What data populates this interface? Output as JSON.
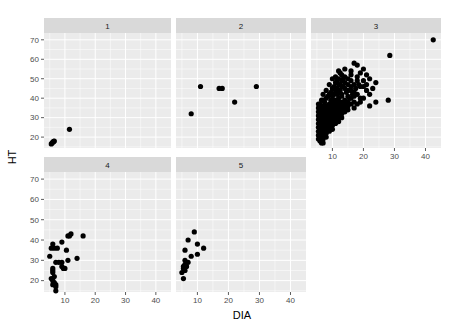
{
  "chart_data": {
    "type": "scatter",
    "title": "",
    "xlabel": "DIA",
    "ylabel": "HT",
    "facet_labels": [
      "1",
      "2",
      "3",
      "4",
      "5"
    ],
    "xlim": [
      3.1,
      45
    ],
    "ylim": [
      14.4,
      73.5
    ],
    "x_ticks": [
      10,
      20,
      30,
      40
    ],
    "y_ticks": [
      20,
      30,
      40,
      50,
      60,
      70
    ],
    "grid": true,
    "legend": "none",
    "colors": {
      "panel_bg": "#ebebeb",
      "strip_bg": "#d9d9d9",
      "grid": "#ffffff",
      "point": "#000000",
      "tick": "#333333"
    },
    "panels": [
      {
        "label": "1",
        "points": [
          [
            5.5,
            16.5
          ],
          [
            5.8,
            17
          ],
          [
            6.1,
            17.5
          ],
          [
            6.5,
            18
          ],
          [
            6.3,
            17.8
          ],
          [
            11.5,
            24
          ]
        ]
      },
      {
        "label": "2",
        "points": [
          [
            8,
            32
          ],
          [
            11,
            46
          ],
          [
            17,
            45
          ],
          [
            18,
            45
          ],
          [
            22,
            38
          ],
          [
            29,
            46
          ]
        ]
      },
      {
        "label": "3",
        "points": [
          [
            42.5,
            70
          ],
          [
            28.5,
            62
          ],
          [
            28,
            39
          ],
          [
            21,
            52
          ],
          [
            22,
            50
          ],
          [
            24,
            48
          ],
          [
            20,
            55
          ],
          [
            18,
            57
          ],
          [
            17,
            58
          ],
          [
            19,
            53
          ],
          [
            16,
            52
          ],
          [
            15,
            50
          ],
          [
            14,
            55
          ],
          [
            13,
            52
          ],
          [
            12,
            54
          ],
          [
            11,
            48
          ],
          [
            12,
            47
          ],
          [
            13,
            46
          ],
          [
            14,
            45
          ],
          [
            15,
            44
          ],
          [
            16,
            44
          ],
          [
            17,
            43
          ],
          [
            18,
            42
          ],
          [
            19,
            40
          ],
          [
            20,
            40
          ],
          [
            22,
            42
          ],
          [
            22,
            36
          ],
          [
            24,
            38
          ],
          [
            21,
            44
          ],
          [
            19,
            46
          ],
          [
            17,
            47
          ],
          [
            16,
            46
          ],
          [
            15,
            41
          ],
          [
            14,
            39
          ],
          [
            13,
            42
          ],
          [
            12,
            43
          ],
          [
            11,
            44
          ],
          [
            10,
            45
          ],
          [
            10,
            41
          ],
          [
            9,
            42
          ],
          [
            8,
            40
          ],
          [
            7,
            39
          ],
          [
            7,
            36
          ],
          [
            6,
            35
          ],
          [
            6,
            33
          ],
          [
            5.5,
            31
          ],
          [
            5.5,
            29
          ],
          [
            5.5,
            27
          ],
          [
            5.5,
            25
          ],
          [
            5.5,
            23
          ],
          [
            5.5,
            21
          ],
          [
            5.5,
            19
          ],
          [
            6,
            18
          ],
          [
            6.5,
            17
          ],
          [
            7,
            17
          ],
          [
            6,
            20
          ],
          [
            6,
            22
          ],
          [
            6,
            24
          ],
          [
            6,
            26
          ],
          [
            6,
            28
          ],
          [
            6,
            30
          ],
          [
            6.5,
            32
          ],
          [
            7,
            34
          ],
          [
            7,
            31
          ],
          [
            7,
            29
          ],
          [
            7,
            27
          ],
          [
            7,
            25
          ],
          [
            7,
            23
          ],
          [
            7,
            21
          ],
          [
            7,
            19
          ],
          [
            8,
            20
          ],
          [
            8,
            22
          ],
          [
            8,
            24
          ],
          [
            8,
            26
          ],
          [
            8,
            28
          ],
          [
            8,
            30
          ],
          [
            8,
            32
          ],
          [
            8,
            34
          ],
          [
            8,
            36
          ],
          [
            9,
            37
          ],
          [
            9,
            35
          ],
          [
            9,
            33
          ],
          [
            9,
            31
          ],
          [
            9,
            29
          ],
          [
            9,
            27
          ],
          [
            9,
            25
          ],
          [
            9,
            23
          ],
          [
            10,
            24
          ],
          [
            10,
            26
          ],
          [
            10,
            28
          ],
          [
            10,
            30
          ],
          [
            10,
            32
          ],
          [
            10,
            34
          ],
          [
            10,
            36
          ],
          [
            10,
            38
          ],
          [
            11,
            39
          ],
          [
            11,
            37
          ],
          [
            11,
            35
          ],
          [
            11,
            33
          ],
          [
            11,
            31
          ],
          [
            11,
            29
          ],
          [
            11,
            27
          ],
          [
            12,
            28
          ],
          [
            12,
            30
          ],
          [
            12,
            32
          ],
          [
            12,
            34
          ],
          [
            12,
            36
          ],
          [
            12,
            38
          ],
          [
            12,
            40
          ],
          [
            13,
            41
          ],
          [
            13,
            38
          ],
          [
            13,
            36
          ],
          [
            13,
            34
          ],
          [
            13,
            32
          ],
          [
            13,
            30
          ],
          [
            14,
            33
          ],
          [
            14,
            35
          ],
          [
            14,
            37
          ],
          [
            15,
            38
          ],
          [
            15,
            36
          ],
          [
            15,
            34
          ],
          [
            16,
            37
          ],
          [
            16,
            40
          ],
          [
            17,
            38
          ],
          [
            18,
            37
          ],
          [
            17,
            35
          ],
          [
            14,
            48
          ],
          [
            13,
            49
          ],
          [
            12,
            50
          ],
          [
            11,
            51
          ],
          [
            10,
            50
          ],
          [
            9,
            47
          ],
          [
            8,
            44
          ],
          [
            7,
            42
          ],
          [
            16,
            49
          ],
          [
            18,
            49
          ],
          [
            20,
            46
          ],
          [
            21,
            47
          ],
          [
            23,
            45
          ],
          [
            19,
            38
          ],
          [
            5.5,
            33
          ],
          [
            6,
            37
          ],
          [
            5.5,
            35
          ],
          [
            7.5,
            38
          ],
          [
            8.5,
            41
          ],
          [
            9.5,
            43
          ],
          [
            10.5,
            46
          ],
          [
            11.5,
            49
          ],
          [
            12.5,
            53
          ],
          [
            14,
            51
          ],
          [
            16,
            54
          ],
          [
            18,
            51
          ],
          [
            20,
            49
          ],
          [
            15,
            47
          ],
          [
            17,
            41
          ],
          [
            6.5,
            23
          ],
          [
            6.5,
            27
          ],
          [
            7.5,
            30
          ],
          [
            8.5,
            33
          ],
          [
            9.5,
            36
          ],
          [
            10.5,
            39
          ],
          [
            11.5,
            42
          ],
          [
            12.5,
            44
          ],
          [
            13.5,
            46
          ],
          [
            14.5,
            43
          ],
          [
            15.5,
            40
          ],
          [
            16.5,
            42
          ],
          [
            17.5,
            45
          ],
          [
            18.5,
            47
          ],
          [
            6.5,
            29
          ],
          [
            7.5,
            25
          ],
          [
            8.5,
            27
          ],
          [
            9.5,
            29
          ],
          [
            10.5,
            31
          ],
          [
            11.5,
            33
          ],
          [
            12.5,
            35
          ],
          [
            13.5,
            37
          ],
          [
            6,
            34
          ],
          [
            5.5,
            37
          ],
          [
            6.5,
            39
          ],
          [
            7.5,
            33
          ],
          [
            8.5,
            35
          ],
          [
            9.5,
            39
          ],
          [
            10.5,
            42
          ],
          [
            11.5,
            45
          ],
          [
            12.5,
            47
          ],
          [
            13.5,
            50
          ]
        ]
      },
      {
        "label": "4",
        "points": [
          [
            11.5,
            42
          ],
          [
            12,
            43
          ],
          [
            11,
            42
          ],
          [
            16,
            42
          ],
          [
            9,
            39
          ],
          [
            10.5,
            35
          ],
          [
            14,
            31
          ],
          [
            11,
            30
          ],
          [
            5,
            32
          ],
          [
            6,
            38
          ],
          [
            5.5,
            36
          ],
          [
            6.5,
            36
          ],
          [
            7.5,
            36
          ],
          [
            7,
            29
          ],
          [
            8,
            29
          ],
          [
            9,
            29
          ],
          [
            9,
            27
          ],
          [
            9.5,
            26
          ],
          [
            10,
            26
          ],
          [
            6,
            26
          ],
          [
            6,
            25
          ],
          [
            6,
            24
          ],
          [
            6.5,
            22
          ],
          [
            5.5,
            21
          ],
          [
            6,
            20
          ],
          [
            6.5,
            19
          ],
          [
            7,
            18
          ],
          [
            7,
            17
          ],
          [
            6,
            18
          ],
          [
            7,
            15
          ]
        ]
      },
      {
        "label": "5",
        "points": [
          [
            9,
            44
          ],
          [
            7,
            40
          ],
          [
            10,
            38
          ],
          [
            12,
            36
          ],
          [
            6,
            35
          ],
          [
            10,
            33
          ],
          [
            8,
            32
          ],
          [
            6,
            30
          ],
          [
            7,
            29
          ],
          [
            6,
            28
          ],
          [
            5.5,
            27
          ],
          [
            6.5,
            27
          ],
          [
            5.5,
            26
          ],
          [
            6,
            25
          ],
          [
            5,
            24
          ],
          [
            5.5,
            21
          ]
        ]
      }
    ]
  }
}
